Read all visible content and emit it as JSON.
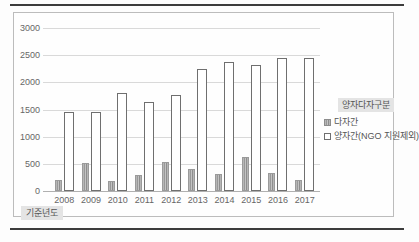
{
  "chart_data": {
    "type": "bar",
    "categories": [
      "2008",
      "2009",
      "2010",
      "2011",
      "2012",
      "2013",
      "2014",
      "2015",
      "2016",
      "2017"
    ],
    "series": [
      {
        "name": "다자간",
        "values": [
          210,
          520,
          180,
          290,
          530,
          400,
          310,
          620,
          340,
          210
        ]
      },
      {
        "name": "양자간(NGO 지원제외)",
        "values": [
          1450,
          1450,
          1800,
          1630,
          1760,
          2240,
          2370,
          2310,
          2450,
          2450
        ]
      }
    ],
    "title": "",
    "xlabel": "기준년도",
    "ylabel": "",
    "ylim": [
      0,
      3000
    ],
    "yticks": [
      0,
      500,
      1000,
      1500,
      2000,
      2500,
      3000
    ],
    "grid": true,
    "legend_position": "right",
    "legend_title": "양자다자구분"
  },
  "colors": {
    "bar_multilateral": "#a6a6a6",
    "bar_bilateral_fill": "#ffffff",
    "bar_bilateral_border": "#6f6f6f",
    "gridline": "#d9d9d9",
    "rule": "#3c3c3c",
    "legend_bg": "#e4e4e4",
    "text": "#555555"
  }
}
